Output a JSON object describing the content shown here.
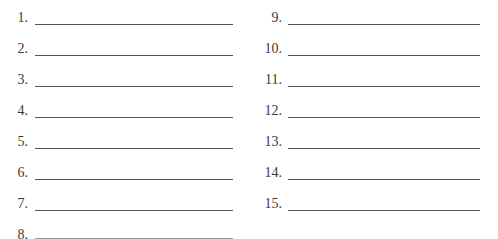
{
  "worksheet": {
    "left_column": [
      {
        "number": "1.",
        "value": ""
      },
      {
        "number": "2.",
        "value": ""
      },
      {
        "number": "3.",
        "value": ""
      },
      {
        "number": "4.",
        "value": ""
      },
      {
        "number": "5.",
        "value": ""
      },
      {
        "number": "6.",
        "value": ""
      },
      {
        "number": "7.",
        "value": ""
      },
      {
        "number": "8.",
        "value": ""
      }
    ],
    "right_column": [
      {
        "number": "9.",
        "value": ""
      },
      {
        "number": "10.",
        "value": ""
      },
      {
        "number": "11.",
        "value": ""
      },
      {
        "number": "12.",
        "value": ""
      },
      {
        "number": "13.",
        "value": ""
      },
      {
        "number": "14.",
        "value": ""
      },
      {
        "number": "15.",
        "value": ""
      }
    ]
  }
}
